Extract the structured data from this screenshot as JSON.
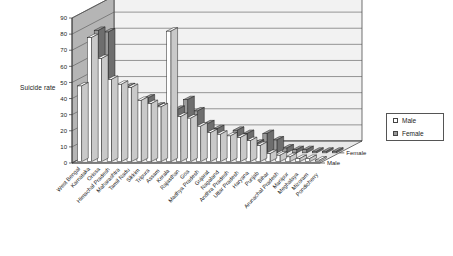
{
  "chart_data": {
    "type": "bar",
    "title": "",
    "subtitle": "",
    "xlabel": "",
    "ylabel": "Suicide rate",
    "zlabel": "",
    "ylim": [
      0,
      90
    ],
    "yticks": [
      0,
      10,
      20,
      30,
      40,
      50,
      60,
      70,
      80,
      90
    ],
    "grid": true,
    "legend_position": "right",
    "projection": "3d-column",
    "depth_axis_labels": [
      "Female",
      "Male"
    ],
    "categories": [
      "West Bengal",
      "Karnataka",
      "Orissa",
      "Himachal Pradesh",
      "Maharashtra",
      "Tamil Nadu",
      "Sikkim",
      "Tripura",
      "Assam",
      "Kerala",
      "Rajasthan",
      "Goa",
      "Madhya Pradesh",
      "Gujarat",
      "Nagaland",
      "Andhra Pradesh",
      "Uttar Pradesh",
      "Haryana",
      "Punjab",
      "Bihar",
      "Arunachal Pradesh",
      "Manipur",
      "Meghalaya",
      "Mizoram",
      "Pondicherry"
    ],
    "series": [
      {
        "name": "Male",
        "color": "#ffffff",
        "values": [
          47,
          77,
          64,
          51,
          48,
          46,
          38,
          36,
          34,
          81,
          28,
          27,
          22,
          18,
          17,
          16,
          15,
          13,
          10,
          5,
          4,
          3,
          2,
          2,
          1
        ]
      },
      {
        "name": "Female",
        "color": "#9a9a9a",
        "values": [
          76,
          75,
          35,
          41,
          18,
          34,
          29,
          27,
          27,
          33,
          26,
          18,
          15,
          7,
          14,
          12,
          6,
          12,
          8,
          3,
          2,
          2,
          1,
          1,
          1
        ]
      }
    ],
    "legend": [
      {
        "label": "Male",
        "swatch": "light"
      },
      {
        "label": "Female",
        "swatch": "gray"
      }
    ],
    "colors": {
      "back_wall": "#f2f2f2",
      "side_wall": "#b5b5b5",
      "floor": "#e8e8e8",
      "gridline": "#555555",
      "axis": "#333333",
      "male_bar": "#ffffff",
      "female_bar": "#9a9a9a"
    }
  }
}
